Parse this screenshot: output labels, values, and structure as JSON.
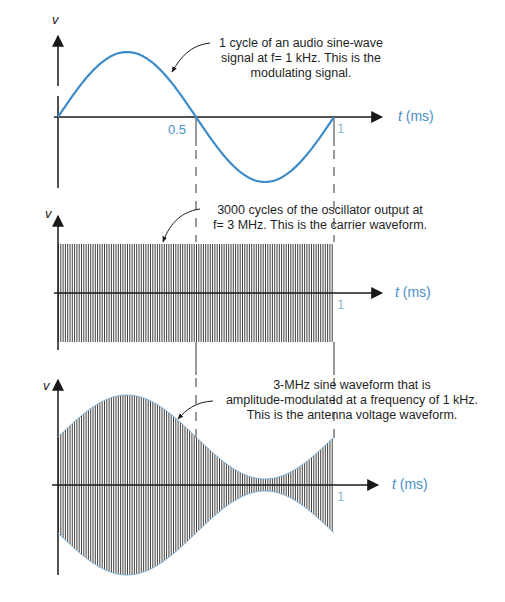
{
  "colors": {
    "signal": "#3d8bc9",
    "axis": "#1a1a1a",
    "carrier": "#2a2a2a",
    "envelope_edge": "#7fb3d8",
    "tick_label": "#4a90c8"
  },
  "panels": [
    {
      "id": "modulating",
      "y_label": "v",
      "x_label_italic": "t",
      "x_label_unit": "(ms)",
      "ticks": [
        "0.5",
        "1"
      ],
      "annotation": [
        "1 cycle of an audio sine-wave",
        "signal at f= 1 kHz.  This is the",
        "modulating signal."
      ]
    },
    {
      "id": "carrier",
      "y_label": "v",
      "x_label_italic": "t",
      "x_label_unit": "(ms)",
      "ticks": [
        "1"
      ],
      "annotation": [
        "3000 cycles of the oscillator output at",
        "f= 3 MHz.  This is the carrier waveform."
      ]
    },
    {
      "id": "am",
      "y_label": "v",
      "x_label_italic": "t",
      "x_label_unit": "(ms)",
      "ticks": [
        "1"
      ],
      "annotation": [
        "3-MHz sine waveform that is",
        "amplitude-modulated  at a frequency of 1 kHz.",
        "This is the antenna voltage waveform."
      ]
    }
  ],
  "chart_data": [
    {
      "type": "line",
      "title": "Modulating signal",
      "xlabel": "t (ms)",
      "ylabel": "v",
      "x": [
        0,
        0.125,
        0.25,
        0.375,
        0.5,
        0.625,
        0.75,
        0.875,
        1.0
      ],
      "series": [
        {
          "name": "audio sine-wave, f = 1 kHz",
          "values": [
            0,
            0.707,
            1,
            0.707,
            0,
            -0.707,
            -1,
            -0.707,
            0
          ]
        }
      ],
      "xlim": [
        0,
        1
      ],
      "ylim": [
        -1,
        1
      ],
      "tick_labels": [
        "0.5",
        "1"
      ],
      "grid": false
    },
    {
      "type": "line",
      "title": "Carrier waveform",
      "xlabel": "t (ms)",
      "ylabel": "v",
      "description": "3000 cycles at f = 3 MHz, constant amplitude",
      "frequency_hz": 3000000,
      "cycles": 3000,
      "amplitude": 1,
      "xlim": [
        0,
        1
      ],
      "tick_labels": [
        "1"
      ],
      "grid": false
    },
    {
      "type": "area",
      "title": "AM antenna voltage waveform",
      "xlabel": "t (ms)",
      "ylabel": "v",
      "description": "3-MHz carrier amplitude-modulated at 1 kHz",
      "carrier_frequency_hz": 3000000,
      "modulating_frequency_hz": 1000,
      "x": [
        0,
        0.25,
        0.5,
        0.75,
        1.0
      ],
      "envelope": [
        0.53,
        1.0,
        0.53,
        0.07,
        0.53
      ],
      "xlim": [
        0,
        1
      ],
      "tick_labels": [
        "1"
      ],
      "grid": false
    }
  ]
}
